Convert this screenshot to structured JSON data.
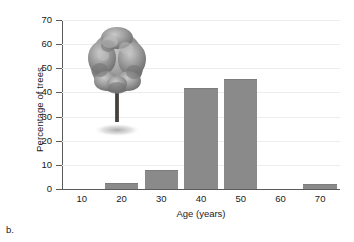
{
  "caption": "b.",
  "chart_data": {
    "type": "bar",
    "title": "",
    "xlabel": "Age (years)",
    "ylabel": "Percentage of trees",
    "categories": [
      "10",
      "20",
      "30",
      "40",
      "50",
      "60",
      "70"
    ],
    "values": [
      0,
      2.5,
      8,
      42,
      45.5,
      0,
      2
    ],
    "xlim": [
      5,
      75
    ],
    "ylim": [
      0,
      70
    ],
    "yticks": [
      "0",
      "10",
      "20",
      "30",
      "40",
      "50",
      "60",
      "70"
    ],
    "ytick_values": [
      0,
      10,
      20,
      30,
      40,
      50,
      60,
      70
    ],
    "xticks": [
      "10",
      "20",
      "30",
      "40",
      "50",
      "60",
      "70"
    ],
    "xtick_values": [
      10,
      20,
      30,
      40,
      50,
      60,
      70
    ],
    "grid": "horizontal",
    "legend": "none",
    "bar_color": "#8a8a8a",
    "axis_color": "#5b5b5b",
    "grid_color": "#ededed",
    "background": "#ffffff"
  },
  "decoration": {
    "tree_illustration": "tree-illustration",
    "canopy_color": "#8c8c8c",
    "trunk_color": "#4a4440",
    "shadow_color": "#9a9a9a"
  }
}
